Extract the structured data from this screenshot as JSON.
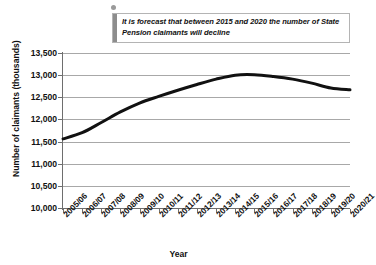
{
  "annotation": {
    "text": "It is forecast that between 2015 and 2020 the number of State Pension claimants will decline",
    "marker_icon": "callout-dot-icon",
    "accent_color": "#8d8d8d",
    "border_color": "#b4b4b4"
  },
  "chart_data": {
    "type": "line",
    "title": "",
    "xlabel": "Year",
    "ylabel": "Number of claimants (thousands)",
    "ylim": [
      10000,
      13500
    ],
    "ytick_step": 500,
    "ytick_labels": [
      "13,500",
      "13,000",
      "12,500",
      "12,000",
      "11,500",
      "11,000",
      "10,500",
      "10,000"
    ],
    "ytick_values": [
      13500,
      13000,
      12500,
      12000,
      11500,
      11000,
      10500,
      10000
    ],
    "grid": true,
    "legend": "none",
    "line_color": "#111111",
    "line_width": 3,
    "categories": [
      "2005/06",
      "2006/07",
      "2007/08",
      "2008/09",
      "2009/10",
      "2010/11",
      "2011/12",
      "2012/13",
      "2013/14",
      "2014/15",
      "2015/16",
      "2016/17",
      "2017/18",
      "2018/19",
      "2019/20",
      "2020/21"
    ],
    "series": [
      {
        "name": "State Pension claimants",
        "values": [
          11560,
          11700,
          11930,
          12170,
          12370,
          12520,
          12660,
          12790,
          12910,
          13000,
          13010,
          12970,
          12910,
          12820,
          12710,
          12670
        ]
      }
    ]
  }
}
